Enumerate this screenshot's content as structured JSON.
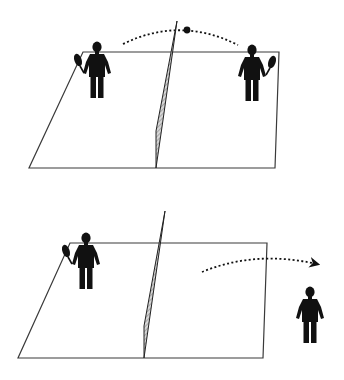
{
  "figure": {
    "panels": [
      {
        "id": "top",
        "description": "Rally in progress: ball travels over the net between two players",
        "court": {
          "points": [
            [
              83,
              52
            ],
            [
              279,
              52
            ],
            [
              275,
              168
            ],
            [
              29,
              168
            ]
          ]
        },
        "net": {
          "points": [
            [
              177,
              21
            ],
            [
              156,
              131
            ],
            [
              156,
              168
            ],
            [
              163,
              120
            ]
          ]
        },
        "players": [
          {
            "role": "left-player",
            "holding_racket": true,
            "racket_side": "left",
            "x": 97,
            "y": 40
          },
          {
            "role": "right-player",
            "holding_racket": true,
            "racket_side": "right",
            "x": 252,
            "y": 45
          }
        ],
        "ball": {
          "x": 187,
          "y": 30
        },
        "trajectory": {
          "type": "dotted-arc",
          "from": [
            123,
            44
          ],
          "to": [
            238,
            45
          ],
          "arrow": false
        }
      },
      {
        "id": "bottom",
        "description": "Player on the right has left the court; ball goes out of bounds",
        "court": {
          "points": [
            [
              70,
              243
            ],
            [
              267,
              243
            ],
            [
              263,
              358
            ],
            [
              18,
              358
            ]
          ]
        },
        "net": {
          "points": [
            [
              165,
              211
            ],
            [
              144,
              326
            ],
            [
              144,
              358
            ],
            [
              151,
              309
            ]
          ]
        },
        "players": [
          {
            "role": "left-player",
            "holding_racket": true,
            "racket_side": "left",
            "x": 86,
            "y": 232
          },
          {
            "role": "off-court-player",
            "holding_racket": false,
            "x": 310,
            "y": 286
          }
        ],
        "trajectory": {
          "type": "dotted-arrow",
          "from": [
            202,
            272
          ],
          "to": [
            319,
            265
          ],
          "arrow": true
        }
      }
    ],
    "colors": {
      "ink": "#111111",
      "court_line": "#3a3a3a",
      "net_fill": "#bdbdbd",
      "background": "#ffffff"
    }
  }
}
